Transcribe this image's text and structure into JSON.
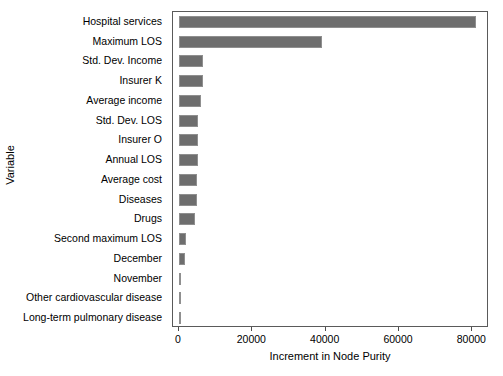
{
  "chart_data": {
    "type": "bar",
    "orientation": "horizontal",
    "title": "",
    "xlabel": "Increment in Node Purity",
    "ylabel": "Variable",
    "xlim": [
      0,
      84000
    ],
    "xticks": [
      0,
      20000,
      40000,
      60000,
      80000
    ],
    "xtick_labels": [
      "0",
      "20000",
      "40000",
      "60000",
      "80000"
    ],
    "grid": false,
    "legend": null,
    "bar_color": "#6e6e6e",
    "bar_edge_color": "#8f8f8f",
    "panel_border_color": "#5a5a5a",
    "categories": [
      "Hospital services",
      "Maximum LOS",
      "Std. Dev. Income",
      "Insurer K",
      "Average income",
      "Std. Dev. LOS",
      "Insurer O",
      "Annual LOS",
      "Average cost",
      "Diseases",
      "Drugs",
      "Second maximum LOS",
      "December",
      "November",
      "Other cardiovascular disease",
      "Long-term pulmonary disease"
    ],
    "values": [
      81000,
      39000,
      6600,
      6500,
      6100,
      5300,
      5200,
      5100,
      5000,
      4900,
      4400,
      2000,
      1500,
      500,
      120,
      60
    ]
  }
}
